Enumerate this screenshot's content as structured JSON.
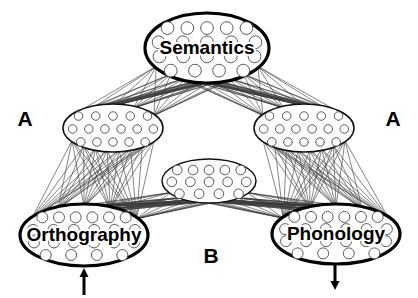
{
  "figure": {
    "type": "neural-network-architecture-diagram",
    "background_color": "#ffffff",
    "width": 418,
    "height": 298
  },
  "nodes": [
    {
      "id": "semantics",
      "label": "Semantics",
      "role": "major-layer",
      "cx": 207,
      "cy": 48,
      "rx": 62,
      "ry": 35,
      "units": 19,
      "unit_rows": [
        5,
        5,
        5,
        4
      ],
      "outline": "bold"
    },
    {
      "id": "orthography",
      "label": "Orthography",
      "role": "major-layer",
      "cx": 84,
      "cy": 235,
      "rx": 64,
      "ry": 31,
      "units": 22,
      "unit_rows": [
        6,
        6,
        6,
        4
      ],
      "outline": "bold"
    },
    {
      "id": "phonology",
      "label": "Phonology",
      "role": "major-layer",
      "cx": 336,
      "cy": 234,
      "rx": 64,
      "ry": 30,
      "units": 22,
      "unit_rows": [
        6,
        6,
        6,
        4
      ],
      "outline": "bold"
    },
    {
      "id": "hidden-left",
      "label": "",
      "role": "hidden-layer",
      "cx": 113,
      "cy": 128,
      "rx": 50,
      "ry": 24,
      "units": 16,
      "unit_rows": [
        5,
        6,
        5
      ],
      "outline": "thin"
    },
    {
      "id": "hidden-right",
      "label": "",
      "role": "hidden-layer",
      "cx": 304,
      "cy": 128,
      "rx": 50,
      "ry": 24,
      "units": 16,
      "unit_rows": [
        5,
        6,
        5
      ],
      "outline": "thin"
    },
    {
      "id": "hidden-middle",
      "label": "",
      "role": "hidden-layer",
      "cx": 209,
      "cy": 181,
      "rx": 47,
      "ry": 22,
      "units": 14,
      "unit_rows": [
        5,
        5,
        4
      ],
      "outline": "thin"
    }
  ],
  "connections": [
    {
      "id": "sem-hleft",
      "from": "semantics",
      "to": "hidden-left",
      "bundle_lines": 40
    },
    {
      "id": "sem-hright",
      "from": "semantics",
      "to": "hidden-right",
      "bundle_lines": 40
    },
    {
      "id": "hleft-orth",
      "from": "hidden-left",
      "to": "orthography",
      "bundle_lines": 40
    },
    {
      "id": "hright-phon",
      "from": "hidden-right",
      "to": "phonology",
      "bundle_lines": 40
    },
    {
      "id": "orth-hmid",
      "from": "orthography",
      "to": "hidden-middle",
      "bundle_lines": 34
    },
    {
      "id": "hmid-phon",
      "from": "hidden-middle",
      "to": "phonology",
      "bundle_lines": 34
    }
  ],
  "pathway_labels": [
    {
      "id": "pathway-a-left",
      "text": "A",
      "x": 25,
      "y": 120
    },
    {
      "id": "pathway-a-right",
      "text": "A",
      "x": 393,
      "y": 120
    },
    {
      "id": "pathway-b",
      "text": "B",
      "x": 211,
      "y": 257
    }
  ],
  "io_arrows": [
    {
      "id": "orthography-input-arrow",
      "direction": "up",
      "x": 84,
      "y_tail": 295,
      "y_head": 268
    },
    {
      "id": "phonology-output-arrow",
      "direction": "down",
      "x": 335,
      "y_tail": 263,
      "y_head": 290
    }
  ],
  "colors": {
    "outline": "#000000",
    "connection": "#3b3b3b",
    "unit_stroke": "#4a4a4a",
    "fill": "#ffffff",
    "text": "#000000"
  }
}
